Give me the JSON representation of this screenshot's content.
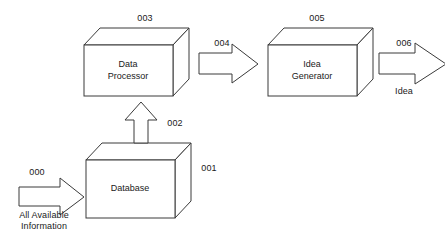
{
  "diagram": {
    "background_color": "#ffffff",
    "stroke_color": "#3a3a3a",
    "text_color": "#1a1a1a",
    "blocks": [
      {
        "ref": "001",
        "label": "Database",
        "ref_label": "001"
      },
      {
        "ref": "003",
        "label": "Data\nProcessor",
        "ref_label": "003"
      },
      {
        "ref": "005",
        "label": "Idea\nGenerator",
        "ref_label": "005"
      }
    ],
    "arrows": [
      {
        "ref": "000",
        "ref_label": "000",
        "caption": "All Available\nInformation",
        "direction": "right",
        "from": "input",
        "to": "001"
      },
      {
        "ref": "002",
        "ref_label": "002",
        "caption": "",
        "direction": "up",
        "from": "001",
        "to": "003"
      },
      {
        "ref": "004",
        "ref_label": "004",
        "caption": "",
        "direction": "right",
        "from": "003",
        "to": "005"
      },
      {
        "ref": "006",
        "ref_label": "006",
        "caption": "Idea",
        "direction": "right",
        "from": "005",
        "to": "output"
      }
    ]
  }
}
